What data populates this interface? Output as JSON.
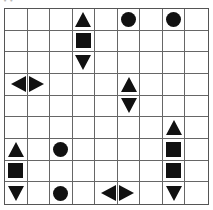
{
  "label": "• •",
  "board": {
    "rows": 9,
    "cols": 9,
    "line_color": "#666666",
    "piece_color": "#111111",
    "pieces": [
      {
        "row": 0,
        "col": 3,
        "shape": "tri-up"
      },
      {
        "row": 0,
        "col": 5,
        "shape": "circle"
      },
      {
        "row": 0,
        "col": 7,
        "shape": "circle"
      },
      {
        "row": 1,
        "col": 3,
        "shape": "square"
      },
      {
        "row": 2,
        "col": 3,
        "shape": "tri-down"
      },
      {
        "row": 3,
        "col": 0,
        "shape": "tri-left"
      },
      {
        "row": 3,
        "col": 1,
        "shape": "tri-right"
      },
      {
        "row": 3,
        "col": 5,
        "shape": "tri-up"
      },
      {
        "row": 4,
        "col": 5,
        "shape": "tri-down"
      },
      {
        "row": 5,
        "col": 7,
        "shape": "tri-up"
      },
      {
        "row": 6,
        "col": 0,
        "shape": "tri-up"
      },
      {
        "row": 6,
        "col": 2,
        "shape": "circle"
      },
      {
        "row": 6,
        "col": 7,
        "shape": "square"
      },
      {
        "row": 7,
        "col": 0,
        "shape": "square"
      },
      {
        "row": 7,
        "col": 7,
        "shape": "square"
      },
      {
        "row": 8,
        "col": 0,
        "shape": "tri-down"
      },
      {
        "row": 8,
        "col": 2,
        "shape": "circle"
      },
      {
        "row": 8,
        "col": 4,
        "shape": "tri-left"
      },
      {
        "row": 8,
        "col": 5,
        "shape": "tri-right"
      },
      {
        "row": 8,
        "col": 7,
        "shape": "tri-down"
      }
    ]
  }
}
